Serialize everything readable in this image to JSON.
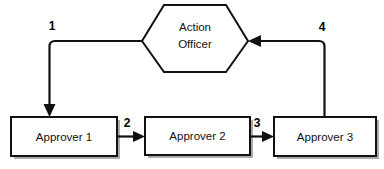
{
  "diagram": {
    "background_color": "#ffffff",
    "line_color": "#111111",
    "node_fill": "#ffffff",
    "shadow_color": "#8e8e8e",
    "nodes": [
      {
        "id": "action-officer",
        "shape": "hexagon",
        "label_line_1": "Action",
        "label_line_2": "Officer"
      },
      {
        "id": "approver-1",
        "shape": "rectangle",
        "label": "Approver 1"
      },
      {
        "id": "approver-2",
        "shape": "rectangle",
        "label": "Approver 2"
      },
      {
        "id": "approver-3",
        "shape": "rectangle",
        "label": "Approver 3"
      }
    ],
    "edges": [
      {
        "id": "edge-1",
        "number": "1",
        "from": "action-officer",
        "to": "approver-1"
      },
      {
        "id": "edge-2",
        "number": "2",
        "from": "approver-1",
        "to": "approver-2"
      },
      {
        "id": "edge-3",
        "number": "3",
        "from": "approver-2",
        "to": "approver-3"
      },
      {
        "id": "edge-4",
        "number": "4",
        "from": "approver-3",
        "to": "action-officer"
      }
    ]
  }
}
